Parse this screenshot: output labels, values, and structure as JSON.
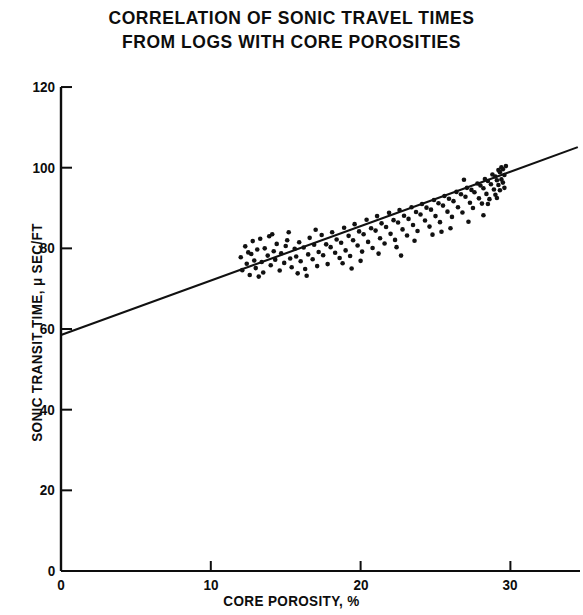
{
  "figure": {
    "title_lines": [
      "CORRELATION OF SONIC TRAVEL TIMES",
      "FROM LOGS WITH CORE POROSITIES"
    ],
    "title_full": "CORRELATION OF SONIC TRAVEL TIMES FROM LOGS WITH CORE POROSITIES",
    "ink_color": "#0d0d0d",
    "background_color": "#ffffff"
  },
  "chart_data": {
    "type": "scatter",
    "title": "CORRELATION OF SONIC TRAVEL TIMES FROM LOGS WITH CORE POROSITIES",
    "subtitle": "",
    "xlabel": "CORE POROSITY, %",
    "ylabel": "SONIC TRANSIT TIME, μ SEC/FT",
    "xlim": [
      0,
      34.5
    ],
    "ylim": [
      0,
      122
    ],
    "xticks": [
      0,
      10,
      20,
      30
    ],
    "yticks": [
      0,
      20,
      40,
      60,
      80,
      100,
      120
    ],
    "xtick_labels": [
      "0",
      "10",
      "20",
      "30"
    ],
    "ytick_labels": [
      "0",
      "20",
      "40",
      "60",
      "80",
      "100",
      "120"
    ],
    "grid": false,
    "legend": null,
    "legend_position": "none",
    "axes_style": "left-and-bottom-spines-only",
    "tick_direction": "out",
    "marker": {
      "shape": "circle",
      "size_px": 4.6,
      "color": "#111111"
    },
    "series": [
      {
        "name": "core plug measurements",
        "type": "scatter",
        "n_points": 152,
        "x_range": [
          11.9,
          29.8
        ],
        "y_range": [
          72.5,
          100.5
        ],
        "points": [
          [
            12.0,
            77.8
          ],
          [
            12.1,
            74.6
          ],
          [
            12.3,
            80.5
          ],
          [
            12.4,
            76.2
          ],
          [
            12.5,
            79.0
          ],
          [
            12.6,
            73.4
          ],
          [
            12.8,
            81.8
          ],
          [
            12.9,
            77.0
          ],
          [
            13.0,
            75.1
          ],
          [
            13.1,
            79.7
          ],
          [
            13.3,
            82.4
          ],
          [
            13.4,
            76.6
          ],
          [
            13.5,
            74.0
          ],
          [
            13.6,
            80.0
          ],
          [
            13.8,
            78.2
          ],
          [
            13.9,
            83.0
          ],
          [
            14.0,
            75.8
          ],
          [
            14.2,
            79.3
          ],
          [
            14.3,
            77.2
          ],
          [
            14.4,
            81.1
          ],
          [
            14.6,
            74.5
          ],
          [
            14.7,
            78.8
          ],
          [
            14.9,
            76.4
          ],
          [
            15.0,
            80.6
          ],
          [
            15.1,
            82.0
          ],
          [
            15.3,
            77.5
          ],
          [
            15.4,
            75.3
          ],
          [
            15.6,
            79.9
          ],
          [
            15.7,
            78.0
          ],
          [
            15.9,
            81.5
          ],
          [
            16.0,
            76.8
          ],
          [
            16.2,
            80.2
          ],
          [
            16.3,
            74.9
          ],
          [
            16.5,
            78.5
          ],
          [
            16.6,
            82.6
          ],
          [
            16.8,
            77.3
          ],
          [
            16.9,
            80.9
          ],
          [
            17.1,
            75.6
          ],
          [
            17.2,
            79.1
          ],
          [
            17.4,
            83.3
          ],
          [
            17.5,
            78.3
          ],
          [
            17.7,
            81.0
          ],
          [
            17.8,
            76.1
          ],
          [
            18.0,
            80.3
          ],
          [
            18.1,
            84.0
          ],
          [
            18.3,
            78.9
          ],
          [
            18.4,
            82.2
          ],
          [
            18.6,
            77.6
          ],
          [
            18.7,
            81.4
          ],
          [
            18.9,
            85.1
          ],
          [
            19.0,
            79.5
          ],
          [
            19.2,
            83.1
          ],
          [
            19.3,
            78.1
          ],
          [
            19.5,
            82.0
          ],
          [
            19.6,
            86.0
          ],
          [
            19.8,
            80.7
          ],
          [
            19.9,
            84.2
          ],
          [
            20.1,
            79.2
          ],
          [
            20.2,
            83.5
          ],
          [
            20.4,
            87.1
          ],
          [
            20.5,
            81.6
          ],
          [
            20.7,
            85.0
          ],
          [
            20.8,
            80.1
          ],
          [
            21.0,
            84.4
          ],
          [
            21.1,
            88.0
          ],
          [
            21.3,
            82.5
          ],
          [
            21.4,
            86.2
          ],
          [
            21.6,
            81.2
          ],
          [
            21.7,
            85.3
          ],
          [
            21.9,
            88.8
          ],
          [
            22.0,
            83.6
          ],
          [
            22.2,
            87.0
          ],
          [
            22.3,
            82.1
          ],
          [
            22.5,
            86.4
          ],
          [
            22.6,
            89.5
          ],
          [
            22.8,
            84.7
          ],
          [
            22.9,
            88.1
          ],
          [
            23.1,
            83.2
          ],
          [
            23.2,
            87.3
          ],
          [
            23.4,
            90.2
          ],
          [
            23.5,
            85.8
          ],
          [
            23.7,
            89.0
          ],
          [
            23.8,
            84.3
          ],
          [
            24.0,
            88.4
          ],
          [
            24.1,
            91.0
          ],
          [
            24.3,
            86.9
          ],
          [
            24.4,
            90.1
          ],
          [
            24.6,
            85.4
          ],
          [
            24.7,
            89.6
          ],
          [
            24.9,
            92.0
          ],
          [
            25.0,
            88.0
          ],
          [
            25.2,
            91.2
          ],
          [
            25.3,
            86.5
          ],
          [
            25.5,
            90.6
          ],
          [
            25.6,
            93.0
          ],
          [
            25.8,
            89.1
          ],
          [
            25.9,
            92.3
          ],
          [
            26.1,
            87.8
          ],
          [
            26.2,
            91.7
          ],
          [
            26.4,
            94.0
          ],
          [
            26.5,
            90.2
          ],
          [
            26.7,
            93.4
          ],
          [
            26.8,
            88.9
          ],
          [
            27.0,
            92.8
          ],
          [
            27.1,
            95.0
          ],
          [
            27.3,
            91.3
          ],
          [
            27.4,
            94.5
          ],
          [
            27.5,
            90.0
          ],
          [
            27.6,
            93.9
          ],
          [
            27.8,
            96.1
          ],
          [
            27.9,
            92.4
          ],
          [
            28.0,
            95.6
          ],
          [
            28.1,
            91.1
          ],
          [
            28.2,
            94.9
          ],
          [
            28.3,
            97.2
          ],
          [
            28.4,
            93.5
          ],
          [
            28.5,
            96.7
          ],
          [
            28.6,
            92.2
          ],
          [
            28.7,
            95.9
          ],
          [
            28.8,
            98.3
          ],
          [
            28.9,
            94.6
          ],
          [
            29.0,
            97.8
          ],
          [
            29.0,
            93.3
          ],
          [
            29.1,
            96.9
          ],
          [
            29.2,
            99.4
          ],
          [
            29.2,
            95.7
          ],
          [
            29.3,
            98.9
          ],
          [
            29.3,
            94.4
          ],
          [
            29.4,
            97.1
          ],
          [
            29.4,
            100.1
          ],
          [
            29.5,
            96.3
          ],
          [
            29.5,
            99.6
          ],
          [
            29.6,
            95.0
          ],
          [
            29.6,
            98.2
          ],
          [
            29.7,
            100.4
          ],
          [
            14.1,
            83.5
          ],
          [
            15.8,
            73.8
          ],
          [
            17.0,
            84.6
          ],
          [
            18.8,
            76.3
          ],
          [
            20.0,
            76.9
          ],
          [
            21.2,
            78.7
          ],
          [
            22.4,
            80.3
          ],
          [
            23.6,
            81.9
          ],
          [
            24.8,
            83.4
          ],
          [
            26.0,
            85.0
          ],
          [
            27.2,
            86.6
          ],
          [
            28.2,
            88.2
          ],
          [
            13.2,
            73.0
          ],
          [
            16.4,
            73.2
          ],
          [
            19.4,
            75.0
          ],
          [
            22.7,
            78.2
          ],
          [
            25.4,
            84.1
          ],
          [
            26.9,
            97.0
          ],
          [
            28.5,
            91.0
          ],
          [
            29.1,
            92.5
          ],
          [
            12.7,
            78.6
          ],
          [
            15.2,
            84.0
          ]
        ]
      },
      {
        "name": "regression line",
        "type": "line",
        "equation": "t = 58.5 + 1.35 × φ",
        "intercept": 58.5,
        "slope": 1.35,
        "x_endpoints": [
          0,
          34.5
        ],
        "y_endpoints": [
          58.5,
          105.1
        ]
      }
    ]
  }
}
